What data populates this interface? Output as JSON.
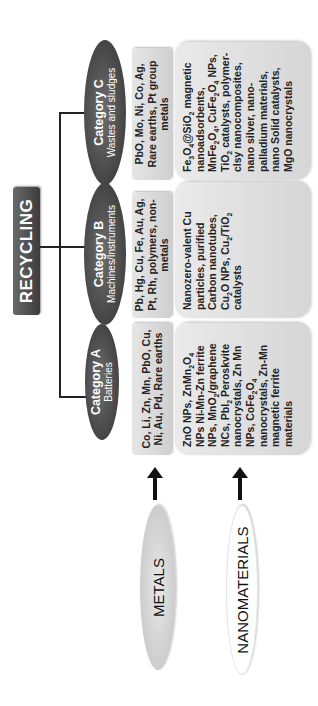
{
  "root": {
    "label": "RECYCLING"
  },
  "categories": [
    {
      "title": "Category A",
      "subtitle": "Batteries",
      "metals": "Co, Li, Zn, Mn, PbO, Cu, Ni, Au, Pd, Rare earths",
      "nanomaterials": "ZnO NPs, ZnMn₂O₄ NPs Ni-Mn-Zn ferrite NPs, MnO₂/graphene NCs, PbI₂ Peroskvite nanocrystals, Zn Mn NPs, CoFe₂O₄ nanocrystals, Zn-Mn magnetic ferrite materials"
    },
    {
      "title": "Category B",
      "subtitle": "Machines/Instruments",
      "metals": "Pb, Hg, Cu, Fe, Au, Ag, Pt, Rh, polymers, non-metals",
      "nanomaterials": "Nanozero-valent Cu particles, purified Carbon nanotubes, Cu₂O NPs, Cu₂/TiO₂ catalysts"
    },
    {
      "title": "Category C",
      "subtitle": "Wastes and sludges",
      "metals": "PbO, Mo, Ni, Co, Ag, Rare earths, Pt group metals",
      "nanomaterials": "Fe₃O₄@SiO₂ magnetic nanoadsorbents, MnFe₂O₄, CuFe₂O₄ NPs, TiO₂ catalysts, polymer-clsy nanocomposites, nano silver, nano-palladium materials, nano Solid catalysts, MgO nanocrystals"
    }
  ],
  "sources": [
    {
      "label": "METALS"
    },
    {
      "label": "NANOMATERIALS"
    }
  ],
  "colors": {
    "dark_node": "#4a4a4a",
    "box_fill": "#dcdcdc",
    "text": "#222222",
    "line": "#222222"
  }
}
